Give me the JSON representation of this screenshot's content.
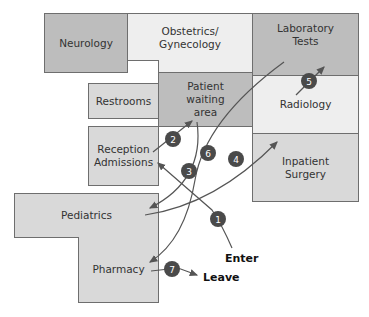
{
  "rooms": {
    "neurology": "Neurology",
    "obgyn": "Obstetrics/\nGynecology",
    "lab": "Laboratory\nTests",
    "waiting": "Patient\nwaiting\narea",
    "radiology": "Radiology",
    "surgery": "Inpatient\nSurgery",
    "restrooms": "Restrooms",
    "reception": "Reception\nAdmissions",
    "pediatrics": "Pediatrics",
    "pharmacy": "Pharmacy"
  },
  "labels": {
    "enter": "Enter",
    "leave": "Leave"
  },
  "steps": [
    {
      "n": "1",
      "from": "Enter",
      "to": "Reception Admissions"
    },
    {
      "n": "2",
      "from": "Reception Admissions",
      "to": "Patient waiting area"
    },
    {
      "n": "3",
      "from": "Patient waiting area",
      "to": "Pediatrics"
    },
    {
      "n": "4",
      "from": "Pediatrics",
      "to": "Radiology"
    },
    {
      "n": "5",
      "from": "Radiology",
      "to": "Laboratory Tests"
    },
    {
      "n": "6",
      "from": "Laboratory Tests",
      "to": "Pharmacy"
    },
    {
      "n": "7",
      "from": "Pharmacy",
      "to": "Leave"
    }
  ],
  "colors": {
    "badge": "#4a4a4a",
    "arrow": "#555555",
    "room_dark": "#bdbdbd",
    "room_light": "#eeeeee",
    "room_mid": "#d9d9d9"
  }
}
